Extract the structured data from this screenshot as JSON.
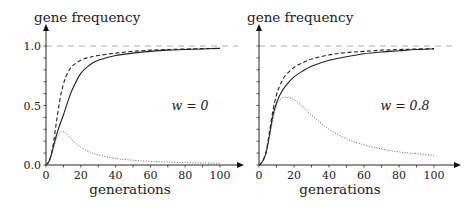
{
  "chart_data": [
    {
      "type": "line",
      "title": "",
      "annotation": "w = 0",
      "xlabel": "generations",
      "ylabel": "gene frequency",
      "xlim": [
        0,
        100
      ],
      "ylim": [
        0,
        1.0
      ],
      "xticks": [
        "0",
        "20",
        "40",
        "60",
        "80",
        "100"
      ],
      "yticks": [
        "0.0",
        "0.5",
        "1.0"
      ],
      "reference_line": {
        "y": 1.0,
        "style": "dashed"
      },
      "x": [
        0,
        2,
        4,
        6,
        8,
        10,
        12,
        15,
        20,
        25,
        30,
        40,
        50,
        60,
        70,
        80,
        90,
        100
      ],
      "series": [
        {
          "name": "solid",
          "style": "solid",
          "values": [
            0,
            0.04,
            0.14,
            0.25,
            0.34,
            0.42,
            0.51,
            0.63,
            0.77,
            0.84,
            0.88,
            0.92,
            0.94,
            0.955,
            0.965,
            0.97,
            0.975,
            0.98
          ]
        },
        {
          "name": "dashed",
          "style": "dashed",
          "values": [
            0,
            0.04,
            0.16,
            0.36,
            0.55,
            0.68,
            0.76,
            0.83,
            0.88,
            0.905,
            0.92,
            0.94,
            0.955,
            0.965,
            0.97,
            0.975,
            0.978,
            0.98
          ]
        },
        {
          "name": "dotted",
          "style": "dotted",
          "values": [
            0,
            0.03,
            0.12,
            0.22,
            0.27,
            0.28,
            0.26,
            0.21,
            0.15,
            0.11,
            0.085,
            0.055,
            0.04,
            0.03,
            0.025,
            0.02,
            0.017,
            0.015
          ]
        }
      ]
    },
    {
      "type": "line",
      "title": "",
      "annotation": "w = 0.8",
      "xlabel": "generations",
      "ylabel": "gene frequency",
      "xlim": [
        0,
        100
      ],
      "ylim": [
        0,
        1.0
      ],
      "xticks": [
        "0",
        "20",
        "40",
        "60",
        "80",
        "100"
      ],
      "yticks": [],
      "reference_line": {
        "y": 1.0,
        "style": "dashed"
      },
      "x": [
        0,
        2,
        4,
        6,
        8,
        10,
        12,
        15,
        20,
        25,
        30,
        40,
        50,
        60,
        70,
        80,
        90,
        100
      ],
      "series": [
        {
          "name": "solid",
          "style": "solid",
          "values": [
            0,
            0.03,
            0.1,
            0.25,
            0.42,
            0.52,
            0.59,
            0.66,
            0.74,
            0.79,
            0.83,
            0.88,
            0.91,
            0.935,
            0.95,
            0.96,
            0.97,
            0.975
          ]
        },
        {
          "name": "dashed",
          "style": "dashed",
          "values": [
            0,
            0.03,
            0.11,
            0.28,
            0.46,
            0.59,
            0.67,
            0.75,
            0.82,
            0.86,
            0.89,
            0.925,
            0.945,
            0.955,
            0.965,
            0.97,
            0.975,
            0.978
          ]
        },
        {
          "name": "dotted",
          "style": "dotted",
          "values": [
            0,
            0.03,
            0.1,
            0.24,
            0.38,
            0.5,
            0.55,
            0.57,
            0.55,
            0.49,
            0.42,
            0.3,
            0.22,
            0.17,
            0.135,
            0.11,
            0.095,
            0.08
          ]
        }
      ]
    }
  ]
}
